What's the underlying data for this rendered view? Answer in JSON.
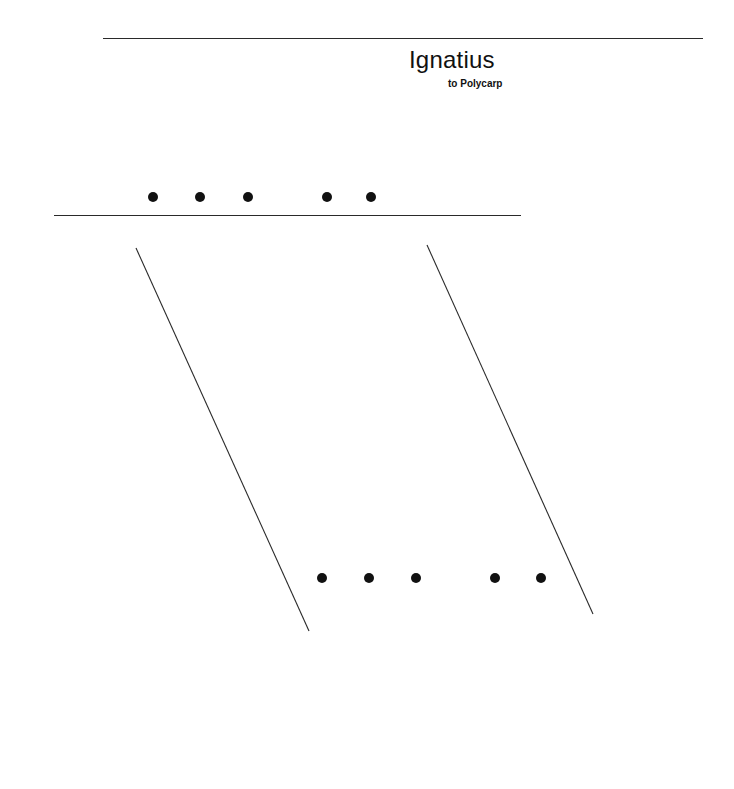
{
  "heading": {
    "title": "Ignatius",
    "subtitle": "to Polycarp"
  },
  "rules": {
    "top": {
      "x1": 103,
      "x2": 703,
      "y": 38
    },
    "middle": {
      "x1": 54,
      "x2": 521,
      "y": 215
    }
  },
  "dot_rows": [
    {
      "name": "upper",
      "y": 197,
      "x": [
        153,
        200,
        248,
        327,
        371
      ]
    },
    {
      "name": "lower",
      "y": 578,
      "x": [
        322,
        369,
        416,
        495,
        541
      ]
    }
  ],
  "slants": [
    {
      "x1": 136,
      "y1": 248,
      "x2": 309,
      "y2": 631
    },
    {
      "x1": 427,
      "y1": 245,
      "x2": 593,
      "y2": 614
    }
  ],
  "colors": {
    "ink": "#111111",
    "background": "#ffffff"
  }
}
